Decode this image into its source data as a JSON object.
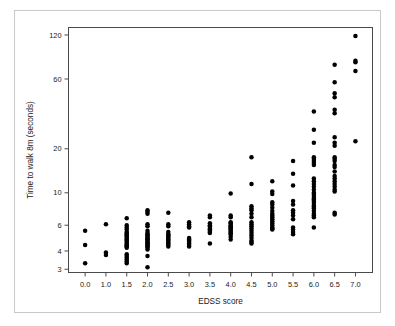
{
  "chart_data": {
    "type": "scatter",
    "title": "",
    "xlabel": "EDSS score",
    "ylabel": "Time to walk 8m (seconds)",
    "x_tick_labels": [
      "0.0",
      "1.0",
      "1.5",
      "2.0",
      "2.5",
      "3.0",
      "3.5",
      "4.0",
      "4.5",
      "5.0",
      "5.5",
      "6.0",
      "6.5",
      "7.0"
    ],
    "y_tick_labels": [
      "3",
      "4",
      "6",
      "10",
      "20",
      "60",
      "120"
    ],
    "y_tick_values": [
      3,
      4,
      6,
      10,
      20,
      60,
      120
    ],
    "y_scale": "log",
    "ylim": [
      2.85,
      135
    ],
    "grid": false,
    "legend": null,
    "marker": "filled-circle",
    "marker_color": "#000000",
    "series": [
      {
        "name": "EDSS 0.0",
        "x_label": "0.0",
        "values": [
          5.5,
          4.4,
          3.3
        ]
      },
      {
        "name": "EDSS 1.0",
        "x_label": "1.0",
        "values": [
          6.1,
          3.9,
          3.75
        ]
      },
      {
        "name": "EDSS 1.5",
        "x_label": "1.5",
        "values": [
          6.7,
          6.0,
          5.8,
          5.6,
          5.4,
          5.3,
          5.2,
          5.1,
          5.0,
          4.9,
          4.8,
          4.7,
          4.6,
          4.5,
          4.4,
          4.35,
          4.3,
          4.2,
          3.8,
          3.7,
          3.6,
          3.5,
          3.4,
          3.3
        ]
      },
      {
        "name": "EDSS 2.0",
        "x_label": "2.0",
        "values": [
          7.6,
          7.4,
          7.2,
          6.1,
          5.9,
          5.5,
          5.3,
          5.2,
          5.1,
          5.0,
          4.9,
          4.85,
          4.8,
          4.7,
          4.6,
          4.55,
          4.5,
          4.4,
          4.35,
          4.3,
          4.2,
          4.1,
          3.7,
          3.1
        ]
      },
      {
        "name": "EDSS 2.5",
        "x_label": "2.5",
        "values": [
          7.3,
          6.1,
          5.9,
          5.4,
          5.2,
          5.1,
          5.0,
          4.9,
          4.8,
          4.7,
          4.6,
          4.5,
          4.4,
          4.3
        ]
      },
      {
        "name": "EDSS 3.0",
        "x_label": "3.0",
        "values": [
          6.3,
          6.1,
          5.9,
          5.8,
          4.9,
          4.8,
          4.7,
          4.6,
          4.5,
          4.4,
          4.3
        ]
      },
      {
        "name": "EDSS 3.5",
        "x_label": "3.5",
        "values": [
          7.0,
          6.8,
          6.2,
          6.0,
          5.9,
          5.7,
          5.6,
          5.5,
          5.4,
          5.3,
          4.5
        ]
      },
      {
        "name": "EDSS 4.0",
        "x_label": "4.0",
        "values": [
          9.9,
          7.0,
          6.8,
          6.3,
          6.2,
          6.0,
          5.9,
          5.8,
          5.7,
          5.6,
          5.5,
          5.4,
          5.3,
          5.2,
          5.0,
          4.8
        ]
      },
      {
        "name": "EDSS 4.5",
        "x_label": "4.5",
        "values": [
          17.5,
          11.5,
          8.1,
          7.8,
          7.6,
          7.2,
          6.8,
          6.3,
          6.1,
          5.9,
          5.7,
          5.5,
          5.3,
          5.1,
          4.9,
          4.7,
          4.6,
          4.5
        ]
      },
      {
        "name": "EDSS 5.0",
        "x_label": "5.0",
        "values": [
          12.0,
          10.2,
          9.8,
          8.6,
          8.3,
          7.9,
          7.5,
          7.2,
          7.0,
          6.8,
          6.6,
          6.4,
          6.2,
          6.0,
          5.8,
          5.7,
          5.6
        ]
      },
      {
        "name": "EDSS 5.5",
        "x_label": "5.5",
        "values": [
          16.5,
          13.5,
          11.2,
          8.8,
          8.3,
          7.6,
          7.3,
          7.0,
          6.6,
          5.8,
          5.6,
          5.4,
          5.2
        ]
      },
      {
        "name": "EDSS 6.0",
        "x_label": "6.0",
        "values": [
          36.0,
          27.0,
          22.0,
          17.5,
          17.0,
          16.5,
          16.0,
          15.5,
          12.5,
          12.0,
          11.5,
          11.0,
          10.5,
          10.0,
          9.8,
          9.5,
          9.2,
          9.0,
          8.8,
          8.5,
          8.2,
          8.0,
          7.8,
          7.5,
          7.2,
          7.0,
          6.8,
          5.8
        ]
      },
      {
        "name": "EDSS 6.5",
        "x_label": "6.5",
        "values": [
          75.0,
          57.0,
          48.0,
          45.0,
          37.0,
          35.0,
          24.0,
          22.0,
          21.0,
          17.5,
          17.0,
          16.5,
          15.5,
          15.0,
          14.0,
          13.0,
          12.5,
          12.0,
          11.5,
          11.0,
          10.5,
          10.2,
          7.3,
          7.1
        ]
      },
      {
        "name": "EDSS 7.0",
        "x_label": "7.0",
        "values": [
          118.0,
          80.0,
          78.0,
          68.0,
          22.5
        ]
      }
    ]
  }
}
